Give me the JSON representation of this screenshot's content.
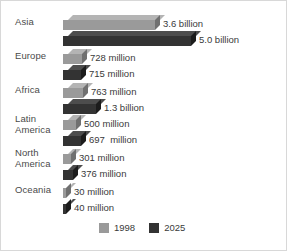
{
  "chart_data": {
    "type": "bar",
    "orientation": "horizontal",
    "title": "",
    "subtitle": "",
    "xlabel": "",
    "ylabel": "",
    "grid": false,
    "legend_position": "bottom-center",
    "categories": [
      "Asia",
      "Europe",
      "Africa",
      "Latin\nAmerica",
      "North\nAmerica",
      "Oceania"
    ],
    "series": [
      {
        "name": "1998",
        "color": "#9a9a9a",
        "values": [
          3600,
          728,
          763,
          500,
          301,
          30
        ],
        "unit": "million",
        "labels": [
          "3.6 billion",
          "728 million",
          "763 million",
          "500 million",
          "301 million",
          "30 million"
        ]
      },
      {
        "name": "2025",
        "color": "#333333",
        "values": [
          5000,
          715,
          1300,
          697,
          376,
          40
        ],
        "unit": "million",
        "labels": [
          "5.0 billion",
          "715 million",
          "1.3 billion",
          "697  million",
          "376 million",
          "40 million"
        ]
      }
    ],
    "xlim": [
      0,
      5000
    ],
    "value_axis_hidden": true
  },
  "legend": {
    "items": [
      {
        "label": "1998",
        "color": "#9a9a9a"
      },
      {
        "label": "2025",
        "color": "#333333"
      }
    ]
  },
  "colors": {
    "series_1998": "#9a9a9a",
    "series_1998_top": "#b4b4b4",
    "series_1998_side": "#707070",
    "series_2025": "#333333",
    "series_2025_top": "#4d4d4d",
    "series_2025_side": "#1c1c1c",
    "text": "#3a3a3a",
    "category_text": "#4a4a4a",
    "background": "#ffffff",
    "border": "#d8d8d8"
  },
  "layout": {
    "bar_origin_x": 62,
    "max_bar_px": 128,
    "rows": [
      {
        "top": 14,
        "label_top": 16
      },
      {
        "top": 48,
        "label_top": 50
      },
      {
        "top": 82,
        "label_top": 84
      },
      {
        "top": 114,
        "label_top": 113
      },
      {
        "top": 148,
        "label_top": 147
      },
      {
        "top": 182,
        "label_top": 184
      }
    ]
  }
}
